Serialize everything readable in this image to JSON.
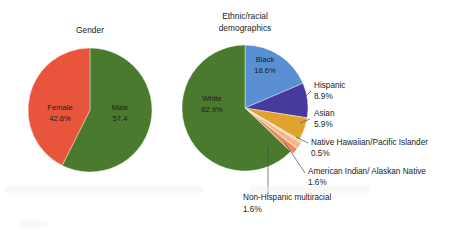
{
  "figure": {
    "background": "#ffffff",
    "width": 451,
    "height": 230
  },
  "charts": {
    "gender": {
      "title": "Gender",
      "title_line1": "Gender",
      "center": {
        "x": 90,
        "y": 110
      },
      "radius": 62
    },
    "ethnicity": {
      "title_line1": "Ethnic/racial",
      "title_line2": "demographics",
      "center": {
        "x": 245,
        "y": 108
      },
      "radius": 63
    }
  },
  "labels": {
    "female_name": "Female",
    "female_value": "42.6%",
    "male_name": "Male",
    "male_value": "57.4",
    "white_name": "White",
    "white_value": "62.9%",
    "black_name": "Black",
    "black_value": "18.6%",
    "hispanic_name": "Hispanic",
    "hispanic_value": "8.9%",
    "asian_name": "Asian",
    "asian_value": "5.9%",
    "nhpi_name": "Native Hawaiian/Pacific Islander",
    "nhpi_value": "0.5%",
    "aian_name": "American Indian/ Alaskan Native",
    "aian_value": "1.6%",
    "multi_name": "Non-Hispanic multiracial",
    "multi_value": "1.6%"
  },
  "chart_data": [
    {
      "type": "pie",
      "title": "Gender",
      "xlabel": "",
      "ylabel": "",
      "legend": "none",
      "units": "percent",
      "categories": [
        "Male",
        "Female"
      ],
      "values": [
        57.4,
        42.6
      ],
      "labels_shown": [
        "Male\n57.4",
        "Female\n42.6%"
      ],
      "colors": [
        "#4a7a2e",
        "#e8553c"
      ],
      "start_angle_deg": 0,
      "direction": "clockwise",
      "slices": [
        {
          "name": "Male",
          "value": 57.4,
          "display_value": "57.4",
          "color": "#4a7a2e",
          "exploded": false
        },
        {
          "name": "Female",
          "value": 42.6,
          "display_value": "42.6%",
          "color": "#e8553c",
          "exploded": false
        }
      ]
    },
    {
      "type": "pie",
      "title": "Ethnic/racial demographics",
      "xlabel": "",
      "ylabel": "",
      "legend": "none",
      "units": "percent",
      "categories": [
        "Black",
        "Hispanic",
        "Asian",
        "Native Hawaiian/Pacific Islander",
        "American Indian/ Alaskan Native",
        "Non-Hispanic multiracial",
        "White"
      ],
      "values": [
        18.6,
        8.9,
        5.9,
        0.5,
        1.6,
        1.6,
        62.9
      ],
      "colors": [
        "#5b8fd4",
        "#473a9e",
        "#e0a32e",
        "#f0c99a",
        "#f2b98c",
        "#ef8a5e",
        "#4a7a2e"
      ],
      "start_angle_deg": 0,
      "direction": "clockwise",
      "slices": [
        {
          "name": "Black",
          "value": 18.6,
          "display_value": "18.6%",
          "color": "#5b8fd4",
          "exploded": false
        },
        {
          "name": "Hispanic",
          "value": 8.9,
          "display_value": "8.9%",
          "color": "#473a9e",
          "exploded": false
        },
        {
          "name": "Asian",
          "value": 5.9,
          "display_value": "5.9%",
          "color": "#e0a32e",
          "exploded": false
        },
        {
          "name": "Native Hawaiian/Pacific Islander",
          "value": 0.5,
          "display_value": "0.5%",
          "color": "#f0c99a",
          "exploded": true
        },
        {
          "name": "American Indian/ Alaskan Native",
          "value": 1.6,
          "display_value": "1.6%",
          "color": "#f2b98c",
          "exploded": true
        },
        {
          "name": "Non-Hispanic multiracial",
          "value": 1.6,
          "display_value": "1.6%",
          "color": "#ef8a5e",
          "exploded": true
        },
        {
          "name": "White",
          "value": 62.9,
          "display_value": "62.9%",
          "color": "#4a7a2e",
          "exploded": false
        }
      ]
    }
  ]
}
